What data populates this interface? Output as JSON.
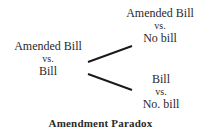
{
  "diagram": {
    "title": "Amendment Paradox",
    "nodes": {
      "left": {
        "line1": "Amended Bill",
        "line2": "vs.",
        "line3": "Bill"
      },
      "top_right": {
        "line1": "Amended Bill",
        "line2": "vs.",
        "line3": "No bill"
      },
      "bottom_right": {
        "line1": "Bill",
        "line2": "vs.",
        "line3": "No. bill"
      }
    },
    "edges": [
      {
        "from": "left",
        "to": "top_right"
      },
      {
        "from": "left",
        "to": "bottom_right"
      }
    ],
    "colors": {
      "text": "#2a2a2a",
      "line": "#1a1a1a",
      "background": "#ffffff"
    }
  }
}
